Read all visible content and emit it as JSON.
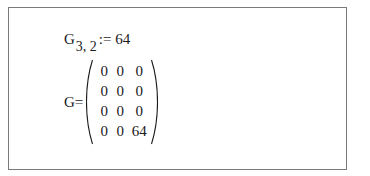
{
  "assignment": {
    "variable": "G",
    "subscript": "3, 2",
    "operator": ":=",
    "value": "64"
  },
  "evaluation": {
    "variable": "G",
    "operator": "=",
    "matrix": [
      [
        "0",
        "0",
        "0"
      ],
      [
        "0",
        "0",
        "0"
      ],
      [
        "0",
        "0",
        "0"
      ],
      [
        "0",
        "0",
        "64"
      ]
    ]
  },
  "colors": {
    "border": "#7a7a7a",
    "text": "#1a1a1a",
    "background": "#ffffff"
  }
}
